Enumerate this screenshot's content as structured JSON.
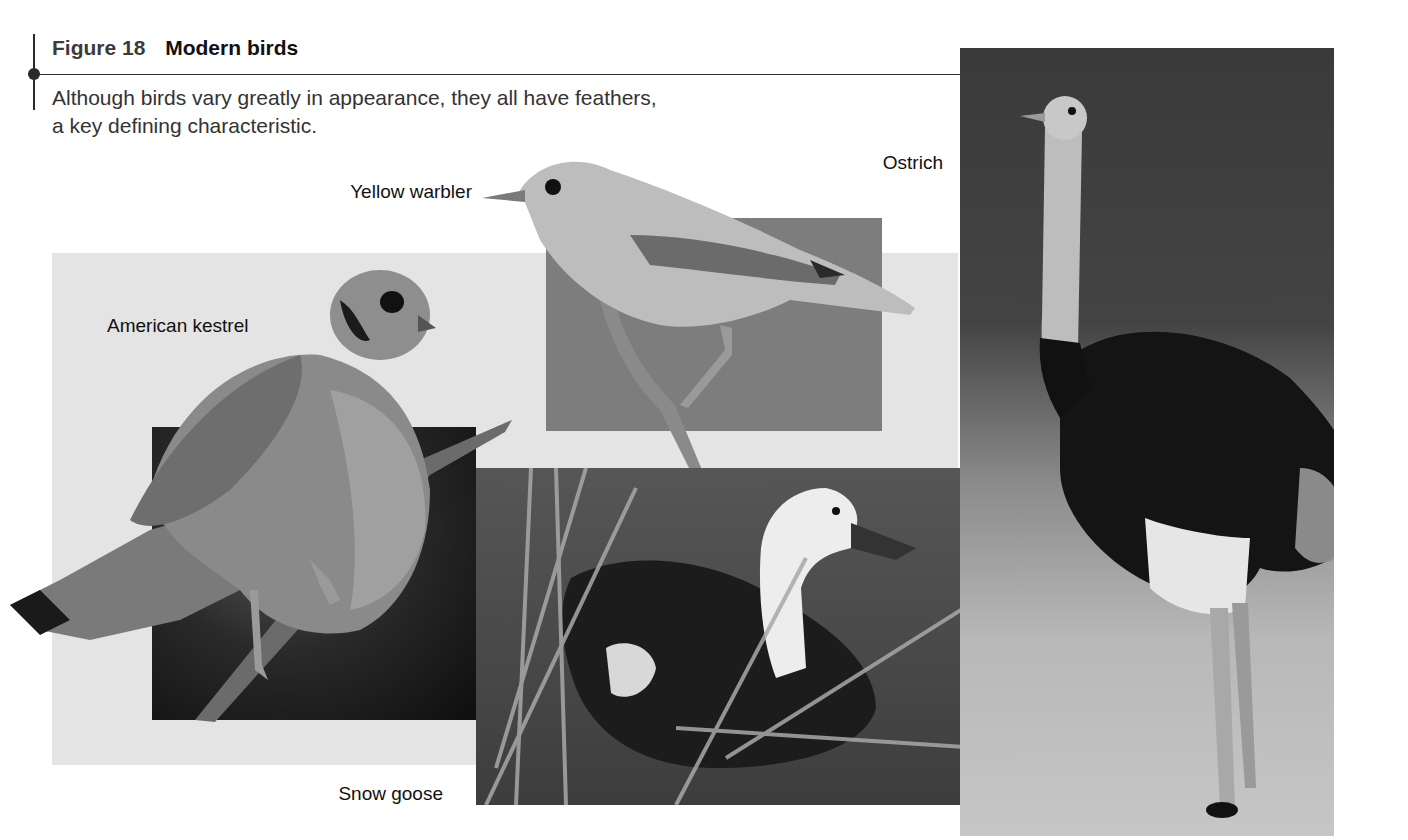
{
  "figure": {
    "number_label": "Figure 18",
    "title": "Modern birds",
    "caption_line1": "Although birds vary greatly in appearance, they all have feathers,",
    "caption_line2": "a key defining characteristic."
  },
  "labels": {
    "yellow_warbler": "Yellow warbler",
    "ostrich": "Ostrich",
    "american_kestrel": "American kestrel",
    "snow_goose": "Snow goose"
  },
  "photos": [
    {
      "id": "american-kestrel",
      "description": "American kestrel perched on a branch against dark background"
    },
    {
      "id": "yellow-warbler",
      "description": "Yellow warbler perched on a twig against gray background"
    },
    {
      "id": "snow-goose",
      "description": "Snow goose (blue morph) swimming among reeds"
    },
    {
      "id": "ostrich",
      "description": "Male ostrich standing in grassland"
    }
  ],
  "colors": {
    "panel_background": "#e4e4e4",
    "rule": "#333333",
    "text": "#111111"
  }
}
